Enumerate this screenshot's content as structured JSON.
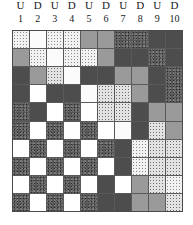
{
  "header": {
    "letters": [
      "U",
      "D",
      "U",
      "D",
      "U",
      "D",
      "U",
      "D",
      "U",
      "D"
    ],
    "numbers": [
      "1",
      "2",
      "3",
      "4",
      "5",
      "6",
      "7",
      "8",
      "9",
      "10"
    ]
  },
  "legend": {
    "fill_names": {
      "white": "white",
      "grey": "medium-grey",
      "dark": "dark-grey",
      "lightdot": "light-speckle",
      "vlightdot": "very-light-speckle",
      "meddot": "medium-speckle",
      "darktex": "dark-mottled",
      "darkspeck": "dark-speckle"
    },
    "colors": {
      "white": "#ffffff",
      "grey": "#9a9a9a",
      "dark": "#4d4d4d",
      "lightdot": "#f2f2f2",
      "vlightdot": "#fbfbfb",
      "meddot": "#e2e2e2",
      "darktex": "#555555",
      "darkspeck": "#5c5c5c",
      "gridline": "#5a5a5a",
      "border": "#4a4a4a",
      "text": "#18181a"
    }
  },
  "chart_data": {
    "type": "heatmap",
    "title": "",
    "xlabel": "",
    "ylabel": "",
    "columns": 10,
    "rows": 10,
    "column_labels": [
      "U 1",
      "D 2",
      "U 3",
      "D 4",
      "U 5",
      "D 6",
      "U 7",
      "D 8",
      "U 9",
      "D 10"
    ],
    "grid": [
      [
        "lightdot",
        "vlightdot",
        "lightdot",
        "lightdot",
        "grey",
        "grey",
        "darktex",
        "darktex",
        "dark",
        "dark"
      ],
      [
        "grey",
        "lightdot",
        "vlightdot",
        "lightdot",
        "lightdot",
        "grey",
        "dark",
        "dark",
        "darktex",
        "dark"
      ],
      [
        "dark",
        "grey",
        "meddot",
        "vlightdot",
        "dark",
        "dark",
        "grey",
        "grey",
        "dark",
        "darktex"
      ],
      [
        "dark",
        "white",
        "dark",
        "dark",
        "vlightdot",
        "meddot",
        "meddot",
        "grey",
        "dark",
        "darktex"
      ],
      [
        "darktex",
        "dark",
        "white",
        "darktex",
        "white",
        "meddot",
        "meddot",
        "dark",
        "grey",
        "grey"
      ],
      [
        "darktex",
        "white",
        "darktex",
        "white",
        "darktex",
        "white",
        "vlightdot",
        "dark",
        "meddot",
        "grey"
      ],
      [
        "white",
        "darktex",
        "white",
        "darktex",
        "white",
        "darktex",
        "dark",
        "lightdot",
        "meddot",
        "meddot"
      ],
      [
        "darktex",
        "white",
        "darktex",
        "white",
        "darktex",
        "white",
        "dark",
        "lightdot",
        "meddot",
        "meddot"
      ],
      [
        "white",
        "darktex",
        "white",
        "darktex",
        "white",
        "dark",
        "white",
        "grey",
        "meddot",
        "lightdot"
      ],
      [
        "darktex",
        "white",
        "darktex",
        "white",
        "darktex",
        "dark",
        "dark",
        "grey",
        "grey",
        "meddot"
      ]
    ]
  }
}
